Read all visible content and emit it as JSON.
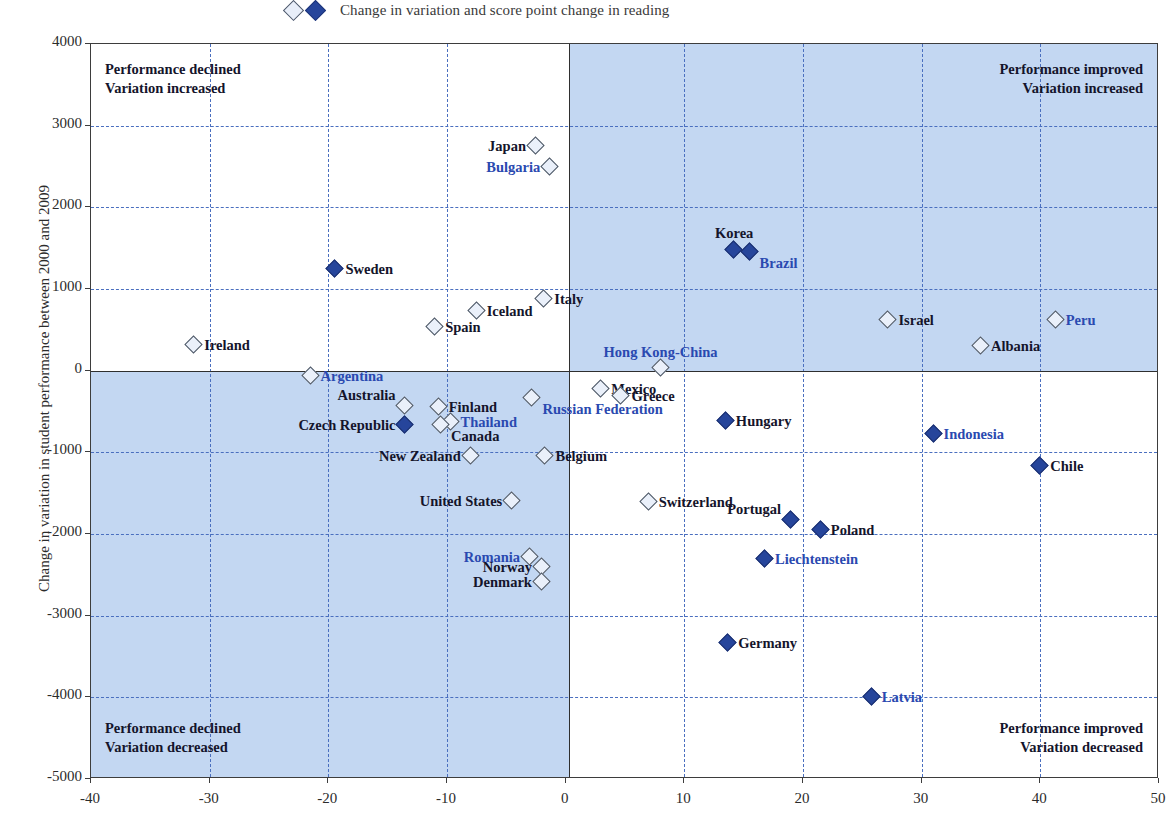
{
  "legend": {
    "markers": [
      "open-diamond",
      "filled-diamond"
    ],
    "text": "Change in variation and score point change in reading"
  },
  "axes": {
    "y_title": "Change in variation in student performance between 2000 and 2009",
    "y_ticks": [
      "4000",
      "3000",
      "2000",
      "1000",
      "0",
      "-1000",
      "-2000",
      "-3000",
      "-4000",
      "-5000"
    ],
    "x_ticks": [
      "-40",
      "-30",
      "-20",
      "-10",
      "0",
      "10",
      "20",
      "30",
      "40",
      "50"
    ]
  },
  "quadrants": {
    "top_left": {
      "line1": "Performance declined",
      "line2": "Variation increased"
    },
    "top_right": {
      "line1": "Performance improved",
      "line2": "Variation increased"
    },
    "bottom_left": {
      "line1": "Performance declined",
      "line2": "Variation decreased"
    },
    "bottom_right": {
      "line1": "Performance improved",
      "line2": "Variation decreased"
    }
  },
  "colors": {
    "quadrant_shade": "#c3d7f2",
    "marker_filled": "#26459b",
    "marker_open": "#eaf0fa",
    "grid": "#4a6fbf",
    "label_dark": "#14142b",
    "label_blue": "#2a49b0"
  },
  "chart_data": {
    "type": "scatter",
    "title": "Change in variation and score point change in reading",
    "xlabel": "",
    "ylabel": "Change in variation in student performance between 2000 and 2009",
    "xlim": [
      -40,
      50
    ],
    "ylim": [
      -5000,
      4000
    ],
    "grid": true,
    "legend_position": "top",
    "series": [
      {
        "name": "open-diamond",
        "marker": "open"
      },
      {
        "name": "filled-diamond",
        "marker": "filled"
      }
    ],
    "points": [
      {
        "label": "Japan",
        "x": -2.5,
        "y": 2750,
        "marker": "open",
        "label_color": "dark",
        "label_pos": "left"
      },
      {
        "label": "Bulgaria",
        "x": -1.3,
        "y": 2500,
        "marker": "open",
        "label_color": "blue",
        "label_pos": "left"
      },
      {
        "label": "Sweden",
        "x": -19.4,
        "y": 1250,
        "marker": "filled",
        "label_color": "dark",
        "label_pos": "right"
      },
      {
        "label": "Italy",
        "x": -1.8,
        "y": 880,
        "marker": "open",
        "label_color": "dark",
        "label_pos": "right"
      },
      {
        "label": "Iceland",
        "x": -7.5,
        "y": 730,
        "marker": "open",
        "label_color": "dark",
        "label_pos": "right"
      },
      {
        "label": "Spain",
        "x": -11.0,
        "y": 530,
        "marker": "open",
        "label_color": "dark",
        "label_pos": "right"
      },
      {
        "label": "Ireland",
        "x": -31.3,
        "y": 320,
        "marker": "open",
        "label_color": "dark",
        "label_pos": "right"
      },
      {
        "label": "Korea",
        "x": 14.2,
        "y": 1480,
        "marker": "filled",
        "label_color": "dark",
        "label_pos": "above"
      },
      {
        "label": "Brazil",
        "x": 15.5,
        "y": 1450,
        "marker": "filled",
        "label_color": "blue",
        "label_pos": "br"
      },
      {
        "label": "Israel",
        "x": 27.2,
        "y": 620,
        "marker": "open",
        "label_color": "dark",
        "label_pos": "right"
      },
      {
        "label": "Peru",
        "x": 41.3,
        "y": 620,
        "marker": "open",
        "label_color": "blue",
        "label_pos": "right"
      },
      {
        "label": "Albania",
        "x": 35.0,
        "y": 300,
        "marker": "open",
        "label_color": "dark",
        "label_pos": "right"
      },
      {
        "label": "Hong Kong-China",
        "x": 8.0,
        "y": 30,
        "marker": "open",
        "label_color": "blue",
        "label_pos": "above"
      },
      {
        "label": "Argentina",
        "x": -21.5,
        "y": -60,
        "marker": "open",
        "label_color": "blue",
        "label_pos": "right"
      },
      {
        "label": "Australia",
        "x": -13.5,
        "y": -430,
        "marker": "open",
        "label_color": "dark",
        "label_pos": "ar"
      },
      {
        "label": "Czech Republic",
        "x": -13.5,
        "y": -670,
        "marker": "filled",
        "label_color": "dark",
        "label_pos": "left"
      },
      {
        "label": "Finland",
        "x": -10.7,
        "y": -450,
        "marker": "open",
        "label_color": "dark",
        "label_pos": "right"
      },
      {
        "label": "Thailand",
        "x": -9.7,
        "y": -630,
        "marker": "open",
        "label_color": "blue",
        "label_pos": "right"
      },
      {
        "label": "Canada",
        "x": -10.5,
        "y": -670,
        "marker": "open",
        "label_color": "dark",
        "label_pos": "br"
      },
      {
        "label": "Russian Federation",
        "x": -2.8,
        "y": -340,
        "marker": "open",
        "label_color": "blue",
        "label_pos": "br"
      },
      {
        "label": "New Zealand",
        "x": -8.0,
        "y": -1050,
        "marker": "open",
        "label_color": "dark",
        "label_pos": "left"
      },
      {
        "label": "Belgium",
        "x": -1.7,
        "y": -1040,
        "marker": "open",
        "label_color": "dark",
        "label_pos": "right"
      },
      {
        "label": "United States",
        "x": -4.5,
        "y": -1590,
        "marker": "open",
        "label_color": "dark",
        "label_pos": "left"
      },
      {
        "label": "Romania",
        "x": -3.0,
        "y": -2280,
        "marker": "open",
        "label_color": "blue",
        "label_pos": "left"
      },
      {
        "label": "Norway",
        "x": -2.0,
        "y": -2400,
        "marker": "open",
        "label_color": "dark",
        "label_pos": "left"
      },
      {
        "label": "Denmark",
        "x": -2.0,
        "y": -2590,
        "marker": "open",
        "label_color": "dark",
        "label_pos": "left"
      },
      {
        "label": "Mexico",
        "x": 3.0,
        "y": -220,
        "marker": "open",
        "label_color": "dark",
        "label_pos": "right"
      },
      {
        "label": "Greece",
        "x": 4.7,
        "y": -310,
        "marker": "open",
        "label_color": "dark",
        "label_pos": "right"
      },
      {
        "label": "Hungary",
        "x": 13.5,
        "y": -620,
        "marker": "filled",
        "label_color": "dark",
        "label_pos": "right"
      },
      {
        "label": "Indonesia",
        "x": 31.0,
        "y": -770,
        "marker": "filled",
        "label_color": "blue",
        "label_pos": "right"
      },
      {
        "label": "Chile",
        "x": 40.0,
        "y": -1170,
        "marker": "filled",
        "label_color": "dark",
        "label_pos": "right"
      },
      {
        "label": "Switzerland",
        "x": 7.0,
        "y": -1610,
        "marker": "open",
        "label_color": "dark",
        "label_pos": "right"
      },
      {
        "label": "Portugal",
        "x": 19.0,
        "y": -1830,
        "marker": "filled",
        "label_color": "dark",
        "label_pos": "ar"
      },
      {
        "label": "Poland",
        "x": 21.5,
        "y": -1950,
        "marker": "filled",
        "label_color": "dark",
        "label_pos": "right"
      },
      {
        "label": "Liechtenstein",
        "x": 16.8,
        "y": -2310,
        "marker": "filled",
        "label_color": "blue",
        "label_pos": "right"
      },
      {
        "label": "Germany",
        "x": 13.7,
        "y": -3340,
        "marker": "filled",
        "label_color": "dark",
        "label_pos": "right"
      },
      {
        "label": "Latvia",
        "x": 25.8,
        "y": -4000,
        "marker": "filled",
        "label_color": "blue",
        "label_pos": "right"
      }
    ]
  }
}
